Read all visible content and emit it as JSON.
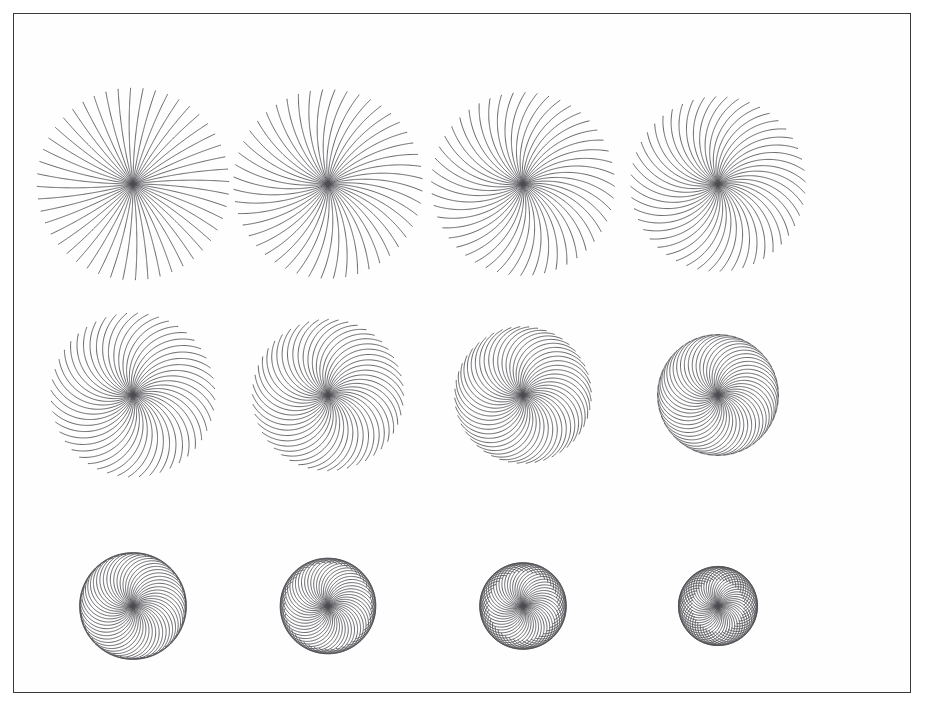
{
  "figure": {
    "title": "Family of rotated circular arcs with increasing bend angle",
    "background_color": "#ffffff",
    "frame_color": "#3a3a3e",
    "stroke_color": "#4b4b50",
    "frame": {
      "x": 13,
      "y": 13,
      "width": 898,
      "height": 680
    },
    "grid": {
      "columns": 4,
      "rows": 3,
      "panel_count": 12
    },
    "layout": {
      "first_center_x": 133,
      "first_center_y": 184,
      "column_spacing": 195,
      "row_spacing": 211
    }
  },
  "chart_data": {
    "type": "line",
    "title": "Family of rotated circular arcs with increasing bend angle",
    "subtitle": "",
    "xlabel": "",
    "ylabel": "",
    "grid": false,
    "legend": "none",
    "arcs_per_panel": 48,
    "angular_step_degrees": 7.5,
    "arc_length_px": 96,
    "panels": [
      {
        "index": 1,
        "row": 1,
        "col": 1,
        "center": [
          133,
          184
        ],
        "bend_degrees": 12,
        "radius_px": 96,
        "envelope_radius_px": 0
      },
      {
        "index": 2,
        "row": 1,
        "col": 2,
        "center": [
          328,
          184
        ],
        "bend_degrees": 38,
        "radius_px": 96,
        "envelope_radius_px": 0
      },
      {
        "index": 3,
        "row": 1,
        "col": 3,
        "center": [
          523,
          184
        ],
        "bend_degrees": 62,
        "radius_px": 96,
        "envelope_radius_px": 0
      },
      {
        "index": 4,
        "row": 1,
        "col": 4,
        "center": [
          718,
          184
        ],
        "bend_degrees": 86,
        "radius_px": 96,
        "envelope_radius_px": 0
      },
      {
        "index": 5,
        "row": 2,
        "col": 1,
        "center": [
          133,
          395
        ],
        "bend_degrees": 110,
        "radius_px": 96,
        "envelope_radius_px": 0
      },
      {
        "index": 6,
        "row": 2,
        "col": 2,
        "center": [
          328,
          395
        ],
        "bend_degrees": 134,
        "radius_px": 96,
        "envelope_radius_px": 0
      },
      {
        "index": 7,
        "row": 2,
        "col": 3,
        "center": [
          523,
          395
        ],
        "bend_degrees": 158,
        "radius_px": 96,
        "envelope_radius_px": 42
      },
      {
        "index": 8,
        "row": 2,
        "col": 4,
        "center": [
          718,
          395
        ],
        "bend_degrees": 182,
        "radius_px": 96,
        "envelope_radius_px": 52
      },
      {
        "index": 9,
        "row": 3,
        "col": 1,
        "center": [
          133,
          606
        ],
        "bend_degrees": 206,
        "radius_px": 96,
        "envelope_radius_px": 60
      },
      {
        "index": 10,
        "row": 3,
        "col": 2,
        "center": [
          328,
          606
        ],
        "bend_degrees": 230,
        "radius_px": 96,
        "envelope_radius_px": 66
      },
      {
        "index": 11,
        "row": 3,
        "col": 3,
        "center": [
          523,
          606
        ],
        "bend_degrees": 254,
        "radius_px": 96,
        "envelope_radius_px": 70
      },
      {
        "index": 12,
        "row": 3,
        "col": 4,
        "center": [
          718,
          606
        ],
        "bend_degrees": 278,
        "radius_px": 96,
        "envelope_radius_px": 74
      }
    ]
  }
}
